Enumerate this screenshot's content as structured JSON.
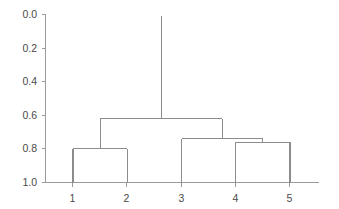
{
  "figure": {
    "background_color": "#ffffff",
    "line_color": "#8c8c8c",
    "axis_color": "#9a9a9a",
    "label_color": "#4a4a4a"
  },
  "chart_data": {
    "type": "line",
    "chart_subtype": "dendrogram",
    "title": "",
    "xlabel": "",
    "ylabel": "",
    "grid": false,
    "legend": null,
    "orientation": "vertical-top-down",
    "ylim": [
      0.0,
      1.0
    ],
    "y_axis_inverted": true,
    "y_ticks": [
      0.0,
      0.2,
      0.4,
      0.6,
      0.8,
      1.0
    ],
    "y_tick_labels": [
      "0.0",
      "0.2",
      "0.4",
      "0.6",
      "0.8",
      "1.0"
    ],
    "leaves": [
      "1",
      "2",
      "3",
      "4",
      "5"
    ],
    "leaf_positions": [
      1,
      2,
      3,
      4,
      5
    ],
    "x_tick_labels": [
      "1",
      "2",
      "3",
      "4",
      "5"
    ],
    "merges": [
      {
        "id": "m1",
        "label": "1-2",
        "left": "1",
        "right": "2",
        "height": 0.8,
        "center": 1.5
      },
      {
        "id": "m2",
        "label": "4-5",
        "left": "4",
        "right": "5",
        "height": 0.76,
        "center": 4.5
      },
      {
        "id": "m3",
        "label": "3-(4,5)",
        "left": "3",
        "right": "m2",
        "height": 0.74,
        "center": 3.75
      },
      {
        "id": "m4",
        "label": "(1,2)-(3,4,5)",
        "left": "m1",
        "right": "m3",
        "height": 0.62,
        "center": 2.625
      }
    ],
    "root": {
      "id": "root-stem",
      "from_height": 0.62,
      "to_height": 0.01,
      "center": 2.625
    }
  }
}
